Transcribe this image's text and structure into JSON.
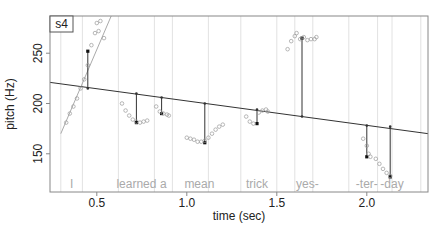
{
  "chart_data": {
    "type": "scatter",
    "title": "",
    "panel_label": "s4",
    "xlabel": "time (sec)",
    "ylabel": "pitch (Hz)",
    "xlim": [
      0.24,
      2.34
    ],
    "ylim": [
      112,
      287
    ],
    "x_ticks": [
      0.5,
      1.0,
      1.5,
      2.0
    ],
    "x_tick_labels": [
      "0.5",
      "1.0",
      "1.5",
      "2.0"
    ],
    "y_ticks": [
      150,
      200,
      250
    ],
    "y_tick_labels": [
      "150",
      "200",
      "250"
    ],
    "grid": false,
    "word_boundaries": [
      0.3,
      0.42,
      0.62,
      0.82,
      0.92,
      1.12,
      1.3,
      1.5,
      1.6,
      1.7,
      1.9,
      2.06,
      2.14,
      2.3
    ],
    "words": [
      {
        "label": "I",
        "x": 0.36
      },
      {
        "label": "learned",
        "x": 0.72
      },
      {
        "label": "a",
        "x": 0.87
      },
      {
        "label": "mean",
        "x": 1.07
      },
      {
        "label": "trick",
        "x": 1.39
      },
      {
        "label": "yes-",
        "x": 1.67
      },
      {
        "label": "-ter-",
        "x": 2.0
      },
      {
        "label": "-day",
        "x": 2.14
      }
    ],
    "declination_line": {
      "x": [
        0.24,
        2.34
      ],
      "y": [
        221,
        170
      ]
    },
    "series": [
      {
        "name": "I",
        "points": [
          [
            0.33,
            181
          ],
          [
            0.35,
            190
          ],
          [
            0.37,
            197
          ],
          [
            0.39,
            205
          ],
          [
            0.41,
            215
          ],
          [
            0.43,
            224
          ],
          [
            0.45,
            238
          ],
          [
            0.47,
            258
          ],
          [
            0.49,
            270
          ],
          [
            0.5,
            280
          ],
          [
            0.52,
            282
          ],
          [
            0.51,
            272
          ],
          [
            0.54,
            265
          ]
        ],
        "fit": [
          [
            0.3,
            170
          ],
          [
            0.58,
            287
          ]
        ],
        "target": {
          "x": 0.45,
          "y": 252,
          "baseline": 215
        }
      },
      {
        "name": "learned",
        "points": [
          [
            0.64,
            200
          ],
          [
            0.66,
            193
          ],
          [
            0.68,
            188
          ],
          [
            0.7,
            184
          ],
          [
            0.72,
            182
          ],
          [
            0.74,
            181
          ],
          [
            0.76,
            182
          ],
          [
            0.78,
            183
          ]
        ],
        "target": {
          "x": 0.72,
          "y": 181,
          "baseline": 210
        }
      },
      {
        "name": "a",
        "points": [
          [
            0.83,
            197
          ],
          [
            0.85,
            192
          ],
          [
            0.87,
            190
          ],
          [
            0.89,
            189
          ],
          [
            0.9,
            188
          ]
        ],
        "target": {
          "x": 0.86,
          "y": 190,
          "baseline": 206
        }
      },
      {
        "name": "mean",
        "points": [
          [
            1.0,
            166
          ],
          [
            1.02,
            165
          ],
          [
            1.04,
            164
          ],
          [
            1.06,
            162
          ],
          [
            1.08,
            162
          ],
          [
            1.1,
            163
          ],
          [
            1.12,
            166
          ],
          [
            1.14,
            170
          ],
          [
            1.16,
            174
          ],
          [
            1.18,
            177
          ],
          [
            1.2,
            179
          ]
        ],
        "target": {
          "x": 1.1,
          "y": 161,
          "baseline": 200
        }
      },
      {
        "name": "trick",
        "points": [
          [
            1.33,
            187
          ],
          [
            1.35,
            182
          ],
          [
            1.37,
            180
          ],
          [
            1.4,
            191
          ],
          [
            1.42,
            193
          ],
          [
            1.44,
            194
          ],
          [
            1.45,
            192
          ]
        ],
        "target": {
          "x": 1.39,
          "y": 180,
          "baseline": 194
        }
      },
      {
        "name": "yes-",
        "points": [
          [
            1.56,
            254
          ],
          [
            1.58,
            262
          ],
          [
            1.6,
            267
          ],
          [
            1.61,
            270
          ],
          [
            1.63,
            264
          ],
          [
            1.65,
            266
          ],
          [
            1.67,
            263
          ],
          [
            1.69,
            264
          ],
          [
            1.71,
            264
          ],
          [
            1.72,
            266
          ]
        ],
        "target": {
          "x": 1.64,
          "y": 265,
          "baseline": 187
        }
      },
      {
        "name": "-ter-",
        "points": [
          [
            1.98,
            165
          ],
          [
            2.0,
            158
          ],
          [
            2.01,
            150
          ],
          [
            2.02,
            147
          ]
        ],
        "target": {
          "x": 2.0,
          "y": 147,
          "baseline": 178
        }
      },
      {
        "name": "-day",
        "points": [
          [
            2.05,
            145
          ],
          [
            2.07,
            140
          ],
          [
            2.09,
            135
          ],
          [
            2.11,
            131
          ],
          [
            2.13,
            128
          ]
        ],
        "target": {
          "x": 2.13,
          "y": 127,
          "baseline": 177
        }
      }
    ]
  }
}
